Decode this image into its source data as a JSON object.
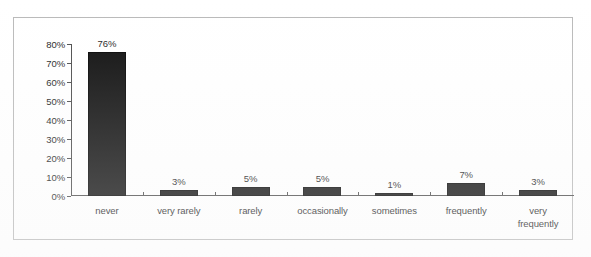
{
  "chart_data": {
    "type": "bar",
    "title": "",
    "xlabel": "",
    "ylabel": "",
    "categories": [
      "never",
      "very rarely",
      "rarely",
      "occasionally",
      "sometimes",
      "frequently",
      "very\nfrequently"
    ],
    "values": [
      76,
      3,
      5,
      5,
      1,
      7,
      3
    ],
    "value_labels": [
      "76%",
      "3%",
      "5%",
      "5%",
      "1%",
      "7%",
      "3%"
    ],
    "ylim": [
      0,
      80
    ],
    "ytick_values": [
      0,
      10,
      20,
      30,
      40,
      50,
      60,
      70,
      80
    ],
    "ytick_labels": [
      "0%",
      "10%",
      "20%",
      "30%",
      "40%",
      "50%",
      "60%",
      "70%",
      "80%"
    ],
    "grid": false,
    "legend": "none",
    "bar_color": "#0d0d0d",
    "axis_color": "#4a4a4a",
    "frame_color": "#b9b9b9",
    "background_color": "#ffffff",
    "text_color": "#1b1b1b"
  }
}
